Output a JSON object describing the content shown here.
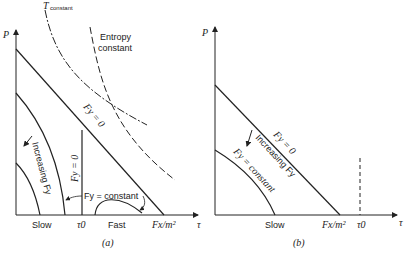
{
  "panel_a": {
    "caption": "(a)",
    "y_axis_label": "P",
    "x_axis_label": "τ",
    "curve_t_constant": {
      "main": "T",
      "sub": "constant"
    },
    "entropy_label_line1": "Entropy",
    "entropy_label_line2": "constant",
    "fy_zero_diagonal": "Fy = 0",
    "fy_zero_vertical": "Fy = 0",
    "increasing_label": "Increasing Fy",
    "fy_constant_label": "Fy = constant",
    "x_ticks": {
      "slow": "Slow",
      "tau0": "τ0",
      "fast": "Fast",
      "fx": "Fx/m²"
    }
  },
  "panel_b": {
    "caption": "(b)",
    "y_axis_label": "P",
    "x_axis_label": "τ",
    "fy_zero_diagonal": "Fy = 0",
    "increasing_label": "Increasing Fy",
    "fy_constant_label": "Fy = constant",
    "x_ticks": {
      "slow": "Slow",
      "fx": "Fx/m²",
      "tau0": "τ0"
    }
  }
}
